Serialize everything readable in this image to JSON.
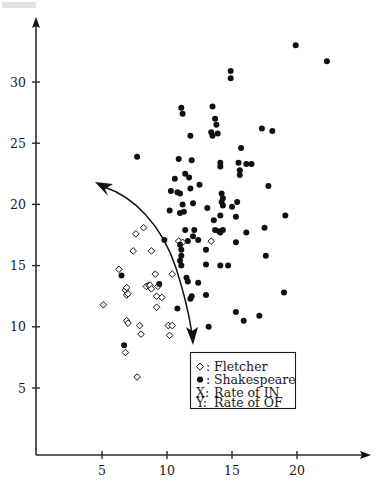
{
  "chart_data": {
    "type": "scatter",
    "title": "",
    "subtitle": "",
    "xlabel": "X: Rate of IN",
    "ylabel": "Y: Rate of OF",
    "xlim": [
      0,
      24.5
    ],
    "ylim": [
      2.8,
      34.5
    ],
    "xticks": [
      5,
      10,
      15,
      20
    ],
    "yticks": [
      5,
      10,
      15,
      20,
      25,
      30
    ],
    "grid": false,
    "legend_position": "inside-bottom-center",
    "series": [
      {
        "name": "Fletcher",
        "marker": "open-diamond",
        "color": "#ffffff",
        "edge_color": "#111111",
        "points": [
          [
            5.1,
            11.8
          ],
          [
            6.3,
            14.7
          ],
          [
            6.8,
            13.0
          ],
          [
            6.9,
            12.6
          ],
          [
            7.0,
            12.7
          ],
          [
            6.9,
            13.2
          ],
          [
            6.9,
            10.5
          ],
          [
            7.0,
            10.3
          ],
          [
            6.8,
            7.9
          ],
          [
            7.4,
            16.2
          ],
          [
            7.6,
            17.6
          ],
          [
            7.7,
            5.9
          ],
          [
            7.9,
            10.1
          ],
          [
            8.0,
            9.4
          ],
          [
            8.2,
            18.1
          ],
          [
            8.4,
            13.3
          ],
          [
            8.6,
            13.4
          ],
          [
            8.7,
            13.4
          ],
          [
            8.8,
            13.1
          ],
          [
            8.8,
            16.2
          ],
          [
            9.1,
            14.3
          ],
          [
            9.3,
            13.3
          ],
          [
            9.2,
            12.5
          ],
          [
            9.2,
            11.6
          ],
          [
            9.6,
            12.4
          ],
          [
            10.1,
            10.1
          ],
          [
            10.4,
            10.1
          ],
          [
            10.4,
            14.3
          ],
          [
            10.2,
            9.3
          ],
          [
            10.9,
            17.0
          ],
          [
            11.2,
            16.9
          ],
          [
            13.4,
            17.0
          ]
        ]
      },
      {
        "name": "Shakespeare",
        "marker": "filled-circle",
        "color": "#111111",
        "points": [
          [
            19.9,
            33.0
          ],
          [
            22.3,
            31.7
          ],
          [
            14.9,
            30.9
          ],
          [
            14.9,
            30.3
          ],
          [
            13.5,
            28.0
          ],
          [
            11.1,
            27.9
          ],
          [
            11.2,
            27.4
          ],
          [
            13.7,
            27.0
          ],
          [
            13.8,
            26.5
          ],
          [
            17.3,
            26.2
          ],
          [
            18.1,
            26.0
          ],
          [
            13.4,
            25.9
          ],
          [
            13.5,
            25.6
          ],
          [
            11.8,
            25.6
          ],
          [
            13.9,
            25.8
          ],
          [
            15.7,
            24.6
          ],
          [
            7.7,
            23.9
          ],
          [
            10.9,
            23.7
          ],
          [
            11.9,
            23.6
          ],
          [
            14.1,
            23.4
          ],
          [
            15.5,
            23.4
          ],
          [
            16.1,
            23.3
          ],
          [
            16.5,
            23.3
          ],
          [
            14.1,
            23.1
          ],
          [
            15.6,
            22.8
          ],
          [
            11.4,
            22.5
          ],
          [
            15.6,
            22.4
          ],
          [
            10.6,
            22.1
          ],
          [
            11.7,
            22.2
          ],
          [
            10.3,
            21.1
          ],
          [
            12.5,
            21.6
          ],
          [
            11.8,
            21.3
          ],
          [
            10.8,
            21.0
          ],
          [
            11.0,
            20.9
          ],
          [
            14.2,
            20.9
          ],
          [
            17.8,
            21.5
          ],
          [
            14.3,
            20.5
          ],
          [
            14.2,
            20.2
          ],
          [
            15.4,
            20.2
          ],
          [
            11.2,
            20.0
          ],
          [
            12.0,
            20.1
          ],
          [
            14.3,
            19.9
          ],
          [
            15.0,
            19.8
          ],
          [
            13.1,
            19.7
          ],
          [
            10.2,
            19.5
          ],
          [
            11.0,
            19.3
          ],
          [
            11.3,
            19.4
          ],
          [
            14.1,
            19.1
          ],
          [
            15.3,
            19.0
          ],
          [
            19.1,
            19.1
          ],
          [
            13.6,
            18.7
          ],
          [
            9.8,
            17.1
          ],
          [
            11.4,
            17.9
          ],
          [
            13.7,
            17.9
          ],
          [
            14.0,
            17.8
          ],
          [
            14.3,
            17.9
          ],
          [
            14.1,
            17.7
          ],
          [
            16.1,
            17.7
          ],
          [
            17.5,
            18.1
          ],
          [
            12.1,
            17.9
          ],
          [
            12.0,
            17.4
          ],
          [
            11.6,
            17.0
          ],
          [
            12.4,
            17.1
          ],
          [
            15.3,
            16.9
          ],
          [
            11.0,
            16.7
          ],
          [
            11.1,
            16.3
          ],
          [
            13.0,
            16.3
          ],
          [
            17.6,
            15.8
          ],
          [
            11.1,
            15.8
          ],
          [
            11.0,
            15.4
          ],
          [
            11.1,
            15.0
          ],
          [
            13.0,
            15.1
          ],
          [
            14.1,
            15.0
          ],
          [
            14.7,
            15.0
          ],
          [
            6.5,
            14.2
          ],
          [
            11.5,
            14.0
          ],
          [
            11.6,
            13.7
          ],
          [
            12.4,
            13.6
          ],
          [
            9.4,
            13.5
          ],
          [
            11.9,
            12.5
          ],
          [
            11.8,
            12.3
          ],
          [
            13.0,
            12.6
          ],
          [
            19.0,
            12.8
          ],
          [
            10.8,
            11.5
          ],
          [
            15.3,
            11.2
          ],
          [
            13.2,
            10.0
          ],
          [
            15.9,
            10.5
          ],
          [
            17.1,
            10.9
          ],
          [
            6.7,
            8.5
          ]
        ]
      }
    ],
    "annotations": [
      {
        "type": "double-arrow-curve",
        "label": "",
        "description": "curved double-headed arrow sweeping from upper-left down through the point cloud"
      }
    ]
  },
  "legend": {
    "entries": [
      {
        "marker": "open-diamond",
        "separator": ":",
        "label": "Fletcher"
      },
      {
        "marker": "filled-circle",
        "separator": ":",
        "label": "Shakespeare"
      }
    ],
    "axis_notes": [
      {
        "key": "X:",
        "label": "Rate of IN"
      },
      {
        "key": "Y:",
        "label": "Rate of OF"
      }
    ]
  },
  "axes": {
    "x_tick_labels": [
      "5",
      "10",
      "15",
      "20"
    ],
    "y_tick_labels": [
      "5",
      "10",
      "15",
      "20",
      "25",
      "30"
    ]
  },
  "colors": {
    "ink": "#111111",
    "axis": "#2b2b2b",
    "background": "#ffffff"
  }
}
